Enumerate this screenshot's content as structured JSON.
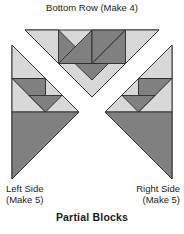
{
  "diagram": {
    "caption": "Partial Blocks",
    "top_block_label": "Bottom Row (Make 4)",
    "left_block_label": "Left Side\n(Make 5)",
    "right_block_label": "Right Side\n(Make 5)",
    "background_color": "#ffffff",
    "colors": {
      "light": "#d8d8d8",
      "medium": "#b0b0b0",
      "dark": "#808080",
      "outline": "#2b2b2b",
      "text": "#1a1a1a"
    },
    "blocks": [
      {
        "name": "bottom-row",
        "label": "Bottom Row (Make 4)",
        "quantity": 4,
        "shape": "inverted-triangle",
        "position": "top-center"
      },
      {
        "name": "left-side",
        "label": "Left Side (Make 5)",
        "quantity": 5,
        "shape": "right-pointing-triangle",
        "position": "left"
      },
      {
        "name": "right-side",
        "label": "Right Side (Make 5)",
        "quantity": 5,
        "shape": "left-pointing-triangle",
        "position": "right"
      }
    ]
  }
}
